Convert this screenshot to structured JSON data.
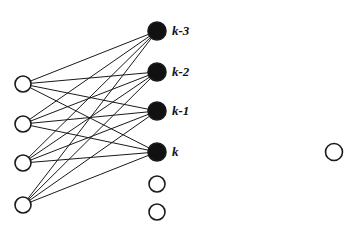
{
  "diagram": {
    "type": "node-link-graph",
    "canvas": {
      "width": 354,
      "height": 236,
      "background": "#ffffff"
    },
    "colors": {
      "stroke": "#1a1a1a",
      "filled_node_fill": "#111111",
      "open_node_fill": "#ffffff",
      "edge": "#1a1a1a",
      "label_text": "#111111"
    },
    "style": {
      "node_stroke_width": 1.6,
      "edge_stroke_width": 1.0,
      "left_node_radius": 8,
      "filled_node_radius": 9,
      "middle_open_node_radius": 8,
      "isolated_node_radius": 8.5
    },
    "left_column": {
      "name": "source-nodes",
      "fill": "open",
      "nodes": [
        {
          "id": "L1",
          "cx": 23,
          "cy": 84
        },
        {
          "id": "L2",
          "cx": 23,
          "cy": 124
        },
        {
          "id": "L3",
          "cx": 23,
          "cy": 163
        },
        {
          "id": "L4",
          "cx": 23,
          "cy": 205
        }
      ]
    },
    "middle_column": {
      "name": "target-nodes",
      "filled_nodes": [
        {
          "id": "M1",
          "cx": 157,
          "cy": 31,
          "label": "k-3",
          "label_x": 172,
          "label_y": 24
        },
        {
          "id": "M2",
          "cx": 157,
          "cy": 72,
          "label": "k-2",
          "label_x": 172,
          "label_y": 65
        },
        {
          "id": "M3",
          "cx": 157,
          "cy": 111,
          "label": "k-1",
          "label_x": 172,
          "label_y": 104
        },
        {
          "id": "M4",
          "cx": 157,
          "cy": 152,
          "label": "k",
          "label_x": 172,
          "label_y": 145
        }
      ],
      "open_nodes": [
        {
          "id": "M5",
          "cx": 157,
          "cy": 184
        },
        {
          "id": "M6",
          "cx": 157,
          "cy": 212
        }
      ]
    },
    "right_column": {
      "name": "isolated-node",
      "nodes": [
        {
          "id": "R1",
          "cx": 334,
          "cy": 152,
          "fill": "open"
        }
      ]
    },
    "edges": [
      {
        "from": "L1",
        "to": "M1"
      },
      {
        "from": "L1",
        "to": "M2"
      },
      {
        "from": "L1",
        "to": "M3"
      },
      {
        "from": "L1",
        "to": "M4"
      },
      {
        "from": "L2",
        "to": "M1"
      },
      {
        "from": "L2",
        "to": "M2"
      },
      {
        "from": "L2",
        "to": "M3"
      },
      {
        "from": "L2",
        "to": "M4"
      },
      {
        "from": "L3",
        "to": "M1"
      },
      {
        "from": "L3",
        "to": "M2"
      },
      {
        "from": "L3",
        "to": "M3"
      },
      {
        "from": "L3",
        "to": "M4"
      },
      {
        "from": "L4",
        "to": "M1"
      },
      {
        "from": "L4",
        "to": "M2"
      },
      {
        "from": "L4",
        "to": "M3"
      },
      {
        "from": "L4",
        "to": "M4"
      }
    ],
    "labels": [
      "k-3",
      "k-2",
      "k-1",
      "k"
    ]
  }
}
